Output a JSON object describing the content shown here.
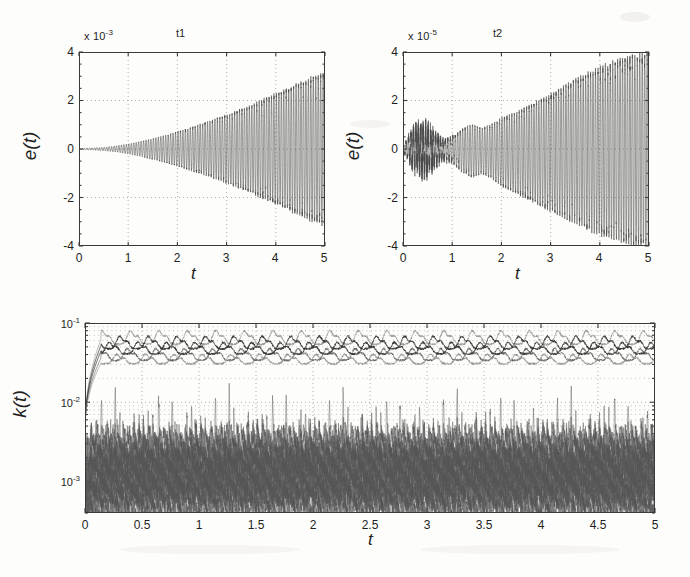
{
  "figure": {
    "background_color": "#fdfdfb",
    "ink_color": "#3a3a3a"
  },
  "panels": [
    {
      "id": "t1",
      "title": "t1",
      "exponent_prefix": "x 10",
      "exponent_value": "-3",
      "xlabel": "t",
      "ylabel": "e(t)",
      "yticks": [
        "4",
        "2",
        "0",
        "-2",
        "-4"
      ],
      "xticks": [
        "0",
        "1",
        "2",
        "3",
        "4",
        "5"
      ]
    },
    {
      "id": "t2",
      "title": "t2",
      "exponent_prefix": "x 10",
      "exponent_value": "-5",
      "xlabel": "t",
      "ylabel": "e(t)",
      "yticks": [
        "4",
        "2",
        "0",
        "-2",
        "-4"
      ],
      "xticks": [
        "0",
        "1",
        "2",
        "3",
        "4",
        "5"
      ]
    },
    {
      "id": "k",
      "title": "",
      "xlabel": "t",
      "ylabel": "k(t)",
      "yticks": [
        "10",
        "10",
        "10"
      ],
      "yexponents": [
        "-1",
        "-2",
        "-3"
      ],
      "xticks": [
        "0",
        "0.5",
        "1",
        "1.5",
        "2",
        "2.5",
        "3",
        "3.5",
        "4",
        "4.5",
        "5"
      ]
    }
  ],
  "chart_data": [
    {
      "type": "line",
      "id": "t1",
      "title": "t1",
      "xlabel": "t",
      "ylabel": "e(t)",
      "y_scale": "linear",
      "y_exponent": -3,
      "y_exponent_label": "x 10^-3",
      "xlim": [
        0,
        5
      ],
      "ylim": [
        -4,
        4
      ],
      "xticks": [
        0,
        1,
        2,
        3,
        4,
        5
      ],
      "yticks": [
        -4,
        -2,
        0,
        2,
        4
      ],
      "grid": "dotted",
      "legend": "none",
      "description": "Tracking error e(t) oscillating at roughly 20 Hz with a monotonically growing envelope; nearly zero until t=0.6, reaching about +/-3.1e-3 at t=5.",
      "envelope": {
        "x": [
          0,
          0.25,
          0.5,
          0.75,
          1.0,
          1.25,
          1.5,
          1.75,
          2.0,
          2.25,
          2.5,
          2.75,
          3.0,
          3.25,
          3.5,
          3.75,
          4.0,
          4.25,
          4.5,
          4.75,
          5.0
        ],
        "upper": [
          0.02,
          0.04,
          0.07,
          0.12,
          0.2,
          0.3,
          0.42,
          0.55,
          0.7,
          0.86,
          1.02,
          1.2,
          1.38,
          1.57,
          1.78,
          2.0,
          2.22,
          2.45,
          2.68,
          2.9,
          3.1
        ],
        "lower": [
          -0.02,
          -0.04,
          -0.07,
          -0.12,
          -0.2,
          -0.3,
          -0.42,
          -0.55,
          -0.7,
          -0.86,
          -1.02,
          -1.2,
          -1.38,
          -1.57,
          -1.78,
          -2.0,
          -2.22,
          -2.45,
          -2.68,
          -2.9,
          -3.1
        ],
        "units": "1e-3"
      },
      "oscillation_frequency_hz": 20
    },
    {
      "type": "line",
      "id": "t2",
      "title": "t2",
      "xlabel": "t",
      "ylabel": "e(t)",
      "y_scale": "linear",
      "y_exponent": -5,
      "y_exponent_label": "x 10^-5",
      "xlim": [
        0,
        5
      ],
      "ylim": [
        -4,
        4
      ],
      "xticks": [
        0,
        1,
        2,
        3,
        4,
        5
      ],
      "yticks": [
        -4,
        -2,
        0,
        2,
        4
      ],
      "grid": "dotted",
      "legend": "none",
      "description": "Tracking error e(t) with noisy start near t=0.2-0.8 (amplitude about 0.8e-5), a dip near t=0.9, then a steadily growing oscillation envelope reaching about +/-3.9e-5 at t=5.",
      "envelope": {
        "x": [
          0,
          0.2,
          0.4,
          0.6,
          0.8,
          1.0,
          1.2,
          1.4,
          1.6,
          1.8,
          2.0,
          2.25,
          2.5,
          2.75,
          3.0,
          3.25,
          3.5,
          3.75,
          4.0,
          4.25,
          4.5,
          4.75,
          5.0
        ],
        "upper": [
          0.1,
          0.75,
          0.8,
          0.65,
          0.35,
          0.5,
          0.8,
          1.0,
          0.85,
          1.0,
          1.25,
          1.45,
          1.7,
          1.95,
          2.2,
          2.5,
          2.8,
          3.05,
          3.3,
          3.5,
          3.65,
          3.8,
          3.9
        ],
        "lower": [
          -0.1,
          -0.7,
          -0.85,
          -0.7,
          -0.4,
          -0.55,
          -0.95,
          -1.15,
          -1.0,
          -1.2,
          -1.5,
          -1.75,
          -2.0,
          -2.25,
          -2.5,
          -2.75,
          -3.0,
          -3.25,
          -3.45,
          -3.6,
          -3.75,
          -3.85,
          -3.95
        ],
        "units": "1e-5"
      },
      "oscillation_frequency_hz": 20
    },
    {
      "type": "line",
      "id": "k",
      "title": "",
      "xlabel": "t",
      "ylabel": "k(t)",
      "y_scale": "log",
      "xlim": [
        0,
        5
      ],
      "ylim": [
        0.0004,
        0.1
      ],
      "xticks": [
        0,
        0.5,
        1,
        1.5,
        2,
        2.5,
        3,
        3.5,
        4,
        4.5,
        5
      ],
      "yticks": [
        0.001,
        0.01,
        0.1
      ],
      "ytick_labels": [
        "10^-3",
        "10^-2",
        "10^-1"
      ],
      "grid": "dotted-minor",
      "legend": "none",
      "description": "Adaptive gains k(t) on a semilog axis. An upper cluster of about five traces rises steeply from 4e-3 at t=0 to a 3e-2 to 7e-2 band with periodic bumps about every 0.25 s. A lower dense cluster of many traces fluctuates between 4e-4 and 3e-3 with periodic spikes reaching 6e-3.",
      "series": [
        {
          "name": "upper-band-1",
          "band": "upper",
          "typical": 0.062,
          "min": 0.045,
          "max": 0.085,
          "style": "light"
        },
        {
          "name": "upper-band-2",
          "band": "upper",
          "typical": 0.052,
          "min": 0.04,
          "max": 0.072,
          "style": "dark"
        },
        {
          "name": "upper-band-3",
          "band": "upper",
          "typical": 0.044,
          "min": 0.035,
          "max": 0.06,
          "style": "dark"
        },
        {
          "name": "upper-band-4",
          "band": "upper",
          "typical": 0.036,
          "min": 0.029,
          "max": 0.05,
          "style": "medium"
        },
        {
          "name": "upper-band-5",
          "band": "upper",
          "typical": 0.031,
          "min": 0.027,
          "max": 0.042,
          "style": "light"
        },
        {
          "name": "lower-band-cluster",
          "band": "lower",
          "typical": 0.0013,
          "min": 0.00045,
          "max": 0.0062,
          "style": "noise",
          "count": 18
        }
      ],
      "bump_period": 0.25
    }
  ]
}
